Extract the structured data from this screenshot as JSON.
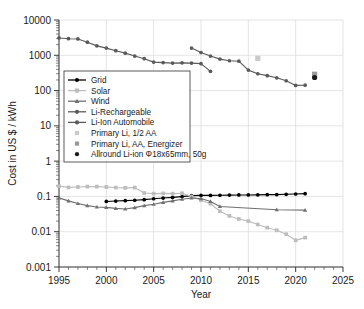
{
  "chart_data": {
    "type": "line",
    "title": "",
    "xlabel": "Year",
    "ylabel": "Cost in US $ / kWh",
    "xlim": [
      1995,
      2025
    ],
    "ylim": [
      0.001,
      10000
    ],
    "yscale": "log",
    "grid": true,
    "legend_position": "upper-left-inside",
    "x_ticks": [
      "1995",
      "2000",
      "2005",
      "2010",
      "2015",
      "2020",
      "2025"
    ],
    "y_ticks": [
      "10000",
      "1000",
      "100",
      "10",
      "1",
      "0.1",
      "0.01",
      "0.001"
    ],
    "colors": {
      "grid_series": "#000000",
      "solar": "#bdbdbd",
      "wind": "#707070",
      "li_rechargeable": "#5a5a5a",
      "li_ion_automobile": "#5a5a5a",
      "primary_li_half_aa": "#c9c9c9",
      "primary_li_aa_energizer": "#9a9a9a",
      "allround_li_ion": "#1a1a1a",
      "gridlines": "#d8d8d8",
      "axis": "#3a3a3a"
    },
    "series": [
      {
        "name": "Grid",
        "marker": "circle",
        "color": "#000000",
        "x": [
          2000,
          2001,
          2002,
          2003,
          2004,
          2005,
          2006,
          2007,
          2008,
          2009,
          2010,
          2011,
          2012,
          2013,
          2014,
          2015,
          2016,
          2017,
          2018,
          2019,
          2020,
          2021
        ],
        "y": [
          0.072,
          0.074,
          0.076,
          0.078,
          0.081,
          0.086,
          0.09,
          0.094,
          0.099,
          0.105,
          0.107,
          0.107,
          0.108,
          0.109,
          0.11,
          0.11,
          0.111,
          0.112,
          0.113,
          0.115,
          0.117,
          0.12
        ]
      },
      {
        "name": "Solar",
        "marker": "square",
        "color": "#bdbdbd",
        "x": [
          1995,
          1996,
          1997,
          1998,
          1999,
          2000,
          2001,
          2002,
          2003,
          2004,
          2005,
          2006,
          2007,
          2008,
          2009,
          2010,
          2011,
          2012,
          2013,
          2014,
          2015,
          2016,
          2017,
          2018,
          2019,
          2020,
          2021
        ],
        "y": [
          0.195,
          0.18,
          0.185,
          0.19,
          0.19,
          0.185,
          0.178,
          0.175,
          0.178,
          0.125,
          0.12,
          0.122,
          0.12,
          0.123,
          0.1,
          0.078,
          0.062,
          0.038,
          0.028,
          0.023,
          0.02,
          0.016,
          0.013,
          0.011,
          0.0085,
          0.0057,
          0.0068
        ]
      },
      {
        "name": "Wind",
        "marker": "triangle",
        "color": "#707070",
        "x": [
          1995,
          1996,
          1997,
          1998,
          1999,
          2000,
          2001,
          2002,
          2003,
          2004,
          2005,
          2006,
          2007,
          2008,
          2009,
          2010,
          2011,
          2012,
          2018,
          2021
        ],
        "y": [
          0.091,
          0.075,
          0.063,
          0.055,
          0.05,
          0.049,
          0.046,
          0.044,
          0.048,
          0.055,
          0.06,
          0.068,
          0.075,
          0.083,
          0.09,
          0.087,
          0.072,
          0.052,
          0.042,
          0.041
        ]
      },
      {
        "name": "Li-Rechargeable",
        "marker": "circle",
        "color": "#5a5a5a",
        "x": [
          1995,
          1996,
          1997,
          1998,
          1999,
          2000,
          2001,
          2002,
          2003,
          2004,
          2005,
          2006,
          2007,
          2008,
          2009,
          2010,
          2011
        ],
        "y": [
          3100,
          2950,
          2900,
          2350,
          1850,
          1600,
          1350,
          1150,
          950,
          800,
          640,
          620,
          600,
          610,
          600,
          580,
          350
        ]
      },
      {
        "name": "Li-Ion Automobile",
        "marker": "circle",
        "color": "#5a5a5a",
        "x": [
          2009,
          2010,
          2011,
          2012,
          2013,
          2014,
          2015,
          2016,
          2017,
          2018,
          2019,
          2020,
          2021
        ],
        "y": [
          1600,
          1200,
          950,
          780,
          700,
          680,
          380,
          300,
          265,
          230,
          190,
          140,
          142
        ]
      },
      {
        "name": "Primary Li, 1/2 AA",
        "marker": "square-point",
        "color": "#c9c9c9",
        "x": [
          2016
        ],
        "y": [
          820
        ]
      },
      {
        "name": "Primary Li, AA, Energizer",
        "marker": "square-point",
        "color": "#9a9a9a",
        "x": [
          2022
        ],
        "y": [
          290
        ]
      },
      {
        "name": "Allround Li-ion Φ18x65mm, 50g",
        "marker": "circle-point",
        "color": "#1a1a1a",
        "x": [
          2022
        ],
        "y": [
          235
        ]
      }
    ],
    "legend_entries": [
      {
        "label": "Grid",
        "style": "line-circle",
        "color": "#000000"
      },
      {
        "label": "Solar",
        "style": "line-square",
        "color": "#bdbdbd"
      },
      {
        "label": "Wind",
        "style": "line-triangle",
        "color": "#707070"
      },
      {
        "label": "Li-Rechargeable",
        "style": "line-circle",
        "color": "#5a5a5a"
      },
      {
        "label": "Li-Ion Automobile",
        "style": "line-circle",
        "color": "#5a5a5a"
      },
      {
        "label": "Primary Li, 1/2 AA",
        "style": "marker-square",
        "color": "#c9c9c9"
      },
      {
        "label": "Primary Li, AA, Energizer",
        "style": "marker-square",
        "color": "#9a9a9a"
      },
      {
        "label": "Allround Li-ion Φ18x65mm, 50g",
        "style": "marker-circle",
        "color": "#1a1a1a"
      }
    ]
  }
}
